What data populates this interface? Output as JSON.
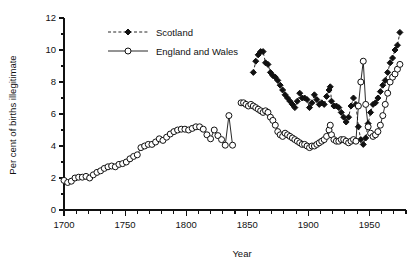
{
  "chart_data": {
    "type": "line",
    "title": "",
    "xlabel": "Year",
    "ylabel": "Per cent of births illegitimate",
    "xlim": [
      1700,
      1980
    ],
    "ylim": [
      0,
      12
    ],
    "xticks": [
      1700,
      1750,
      1800,
      1850,
      1900,
      1950
    ],
    "xticklabels": [
      "1700",
      "1750",
      "1800",
      "1850",
      "1900",
      "1950"
    ],
    "xminor_step": 10,
    "yticks": [
      0,
      2,
      4,
      6,
      8,
      10,
      12
    ],
    "yticklabels": [
      "0",
      "2",
      "4",
      "6",
      "8",
      "10",
      "12"
    ],
    "yminor": [
      1,
      3,
      5,
      7,
      9,
      11
    ],
    "grid": false,
    "legend_position": "top-left-inside",
    "series": [
      {
        "name": "Scotland",
        "marker": "filled-diamond",
        "linestyle": "dashed",
        "color": "#111111",
        "points": [
          [
            1855,
            8.6
          ],
          [
            1857,
            9.3
          ],
          [
            1859,
            9.7
          ],
          [
            1861,
            9.9
          ],
          [
            1863,
            9.9
          ],
          [
            1865,
            9.2
          ],
          [
            1867,
            9.1
          ],
          [
            1869,
            8.6
          ],
          [
            1871,
            8.4
          ],
          [
            1873,
            8.3
          ],
          [
            1875,
            8.1
          ],
          [
            1877,
            7.8
          ],
          [
            1879,
            7.5
          ],
          [
            1881,
            7.2
          ],
          [
            1883,
            7.0
          ],
          [
            1885,
            6.8
          ],
          [
            1887,
            6.6
          ],
          [
            1889,
            6.4
          ],
          [
            1891,
            6.8
          ],
          [
            1893,
            7.3
          ],
          [
            1895,
            7.0
          ],
          [
            1897,
            7.0
          ],
          [
            1899,
            6.9
          ],
          [
            1901,
            6.4
          ],
          [
            1903,
            6.7
          ],
          [
            1905,
            7.2
          ],
          [
            1907,
            6.9
          ],
          [
            1909,
            6.6
          ],
          [
            1911,
            6.7
          ],
          [
            1913,
            6.6
          ],
          [
            1915,
            7.1
          ],
          [
            1917,
            7.5
          ],
          [
            1918,
            7.7
          ],
          [
            1919,
            6.8
          ],
          [
            1921,
            6.5
          ],
          [
            1923,
            6.5
          ],
          [
            1925,
            6.4
          ],
          [
            1927,
            6.1
          ],
          [
            1929,
            5.8
          ],
          [
            1931,
            5.5
          ],
          [
            1933,
            5.8
          ],
          [
            1935,
            6.5
          ],
          [
            1937,
            7.0
          ],
          [
            1939,
            6.6
          ],
          [
            1941,
            5.2
          ],
          [
            1943,
            4.4
          ],
          [
            1945,
            4.1
          ],
          [
            1947,
            4.5
          ],
          [
            1949,
            5.4
          ],
          [
            1951,
            6.1
          ],
          [
            1953,
            6.6
          ],
          [
            1955,
            6.7
          ],
          [
            1957,
            7.0
          ],
          [
            1959,
            7.4
          ],
          [
            1961,
            7.8
          ],
          [
            1963,
            8.1
          ],
          [
            1965,
            8.6
          ],
          [
            1967,
            9.2
          ],
          [
            1969,
            9.5
          ],
          [
            1971,
            10.0
          ],
          [
            1973,
            10.3
          ],
          [
            1975,
            11.1
          ]
        ]
      },
      {
        "name": "England and Wales",
        "marker": "open-circle",
        "linestyle": "solid",
        "color": "#111111",
        "segments": [
          {
            "points": [
              [
                1700,
                1.85
              ],
              [
                1703,
                1.72
              ],
              [
                1706,
                1.8
              ],
              [
                1709,
                2.0
              ],
              [
                1712,
                2.05
              ],
              [
                1715,
                2.05
              ],
              [
                1718,
                2.1
              ],
              [
                1721,
                2.0
              ],
              [
                1724,
                2.2
              ],
              [
                1727,
                2.35
              ],
              [
                1730,
                2.45
              ],
              [
                1733,
                2.6
              ],
              [
                1736,
                2.7
              ],
              [
                1739,
                2.75
              ],
              [
                1742,
                2.7
              ],
              [
                1745,
                2.85
              ],
              [
                1748,
                2.9
              ],
              [
                1751,
                3.0
              ],
              [
                1754,
                3.2
              ],
              [
                1757,
                3.35
              ],
              [
                1760,
                3.45
              ],
              [
                1763,
                3.9
              ],
              [
                1766,
                4.0
              ],
              [
                1769,
                4.1
              ],
              [
                1772,
                4.1
              ],
              [
                1775,
                4.25
              ],
              [
                1778,
                4.45
              ],
              [
                1781,
                4.35
              ],
              [
                1784,
                4.55
              ],
              [
                1787,
                4.75
              ],
              [
                1790,
                4.9
              ],
              [
                1793,
                5.0
              ],
              [
                1796,
                5.05
              ],
              [
                1799,
                5.05
              ],
              [
                1802,
                5.0
              ],
              [
                1805,
                5.1
              ],
              [
                1808,
                5.2
              ],
              [
                1811,
                5.2
              ],
              [
                1814,
                5.05
              ],
              [
                1817,
                4.7
              ],
              [
                1820,
                4.45
              ],
              [
                1823,
                5.0
              ],
              [
                1826,
                4.65
              ],
              [
                1829,
                4.4
              ],
              [
                1832,
                4.05
              ],
              [
                1835,
                5.9
              ],
              [
                1838,
                4.05
              ]
            ]
          },
          {
            "points": [
              [
                1845,
                6.7
              ],
              [
                1847,
                6.7
              ],
              [
                1849,
                6.6
              ],
              [
                1851,
                6.5
              ],
              [
                1853,
                6.6
              ],
              [
                1855,
                6.5
              ],
              [
                1857,
                6.4
              ],
              [
                1859,
                6.3
              ],
              [
                1861,
                6.2
              ],
              [
                1863,
                6.1
              ],
              [
                1865,
                6.2
              ],
              [
                1867,
                6.1
              ],
              [
                1869,
                5.8
              ],
              [
                1871,
                5.6
              ],
              [
                1873,
                5.3
              ],
              [
                1875,
                4.9
              ],
              [
                1877,
                4.7
              ],
              [
                1879,
                4.6
              ],
              [
                1881,
                4.8
              ],
              [
                1883,
                4.7
              ],
              [
                1885,
                4.6
              ],
              [
                1887,
                4.5
              ],
              [
                1889,
                4.4
              ],
              [
                1891,
                4.3
              ],
              [
                1893,
                4.2
              ],
              [
                1895,
                4.1
              ],
              [
                1897,
                4.1
              ],
              [
                1899,
                4.0
              ],
              [
                1901,
                3.9
              ],
              [
                1903,
                4.0
              ],
              [
                1905,
                4.0
              ],
              [
                1907,
                4.1
              ],
              [
                1909,
                4.2
              ],
              [
                1911,
                4.3
              ],
              [
                1913,
                4.4
              ],
              [
                1915,
                4.6
              ],
              [
                1917,
                5.0
              ],
              [
                1918,
                5.3
              ],
              [
                1919,
                4.7
              ],
              [
                1921,
                4.4
              ],
              [
                1923,
                4.3
              ],
              [
                1925,
                4.3
              ],
              [
                1927,
                4.4
              ],
              [
                1929,
                4.4
              ],
              [
                1931,
                4.3
              ],
              [
                1933,
                4.2
              ],
              [
                1935,
                4.3
              ],
              [
                1937,
                4.4
              ],
              [
                1939,
                4.3
              ],
              [
                1941,
                6.5
              ],
              [
                1943,
                8.0
              ],
              [
                1945,
                9.3
              ],
              [
                1947,
                6.6
              ],
              [
                1949,
                5.2
              ],
              [
                1951,
                4.8
              ],
              [
                1953,
                4.6
              ],
              [
                1955,
                4.7
              ],
              [
                1957,
                4.9
              ],
              [
                1959,
                5.3
              ],
              [
                1961,
                5.9
              ],
              [
                1963,
                6.6
              ],
              [
                1965,
                7.3
              ],
              [
                1967,
                8.0
              ],
              [
                1969,
                8.3
              ],
              [
                1971,
                8.5
              ],
              [
                1973,
                8.8
              ],
              [
                1975,
                9.1
              ]
            ]
          }
        ]
      }
    ],
    "legend": [
      {
        "label": "Scotland",
        "marker": "filled-diamond",
        "linestyle": "dashed"
      },
      {
        "label": "England and Wales",
        "marker": "open-circle",
        "linestyle": "solid"
      }
    ]
  }
}
